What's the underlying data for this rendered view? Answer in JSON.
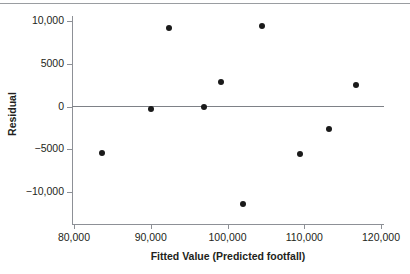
{
  "chart_data": {
    "type": "scatter",
    "title": "",
    "xlabel": "Fitted Value (Predicted footfall)",
    "ylabel": "Residual",
    "xlim": [
      78000,
      122000
    ],
    "ylim": [
      -13000,
      11500
    ],
    "grid": false,
    "legend": null,
    "reference_line": {
      "orientation": "horizontal",
      "y": 0
    },
    "xticks": [
      80000,
      90000,
      100000,
      110000,
      120000
    ],
    "xticklabels": [
      "80,000",
      "90,000",
      "100,000",
      "110,000",
      "120,000"
    ],
    "yticks": [
      10000,
      5000,
      0,
      -5000,
      -10000
    ],
    "yticklabels": [
      "10,000",
      "5000",
      "0",
      "−5000",
      "−10,000"
    ],
    "marker_color": "#1a1a1a",
    "axis_color": "#8d9096",
    "points": [
      {
        "x": 83600,
        "y": -5400
      },
      {
        "x": 90000,
        "y": -300
      },
      {
        "x": 92400,
        "y": 9200
      },
      {
        "x": 97000,
        "y": -100
      },
      {
        "x": 99200,
        "y": 2900
      },
      {
        "x": 102000,
        "y": -11400
      },
      {
        "x": 104500,
        "y": 9400
      },
      {
        "x": 109400,
        "y": -5500
      },
      {
        "x": 113200,
        "y": -2600
      },
      {
        "x": 116700,
        "y": 2500
      }
    ]
  }
}
